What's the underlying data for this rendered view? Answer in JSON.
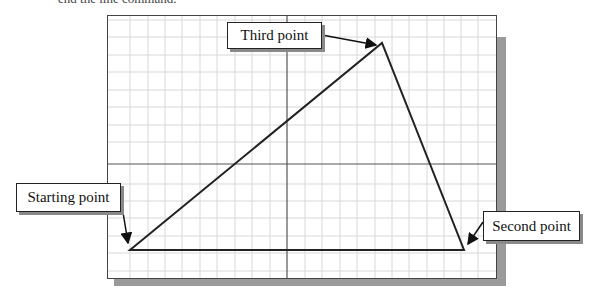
{
  "caption": "end the line command.",
  "diagram": {
    "grid": {
      "spacing_px": 17.5,
      "color": "#d8d8d8",
      "axis_color": "#555555"
    },
    "frame_color": "#444444",
    "shadow_color": "#9a9a9a",
    "line_color": "#222222",
    "points": {
      "start": {
        "x": 130,
        "y": 250
      },
      "second": {
        "x": 464,
        "y": 250
      },
      "third": {
        "x": 382,
        "y": 43
      }
    },
    "callouts": [
      {
        "id": "third",
        "label": "Third point"
      },
      {
        "id": "start",
        "label": "Starting point"
      },
      {
        "id": "second",
        "label": "Second point"
      }
    ]
  }
}
